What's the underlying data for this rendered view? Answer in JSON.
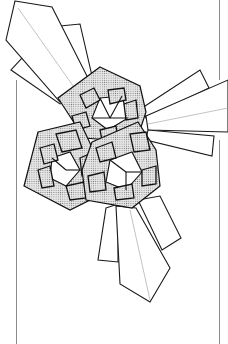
{
  "figure": {
    "kind": "origami line illustration",
    "units": 3,
    "ray_groups": [
      "top-left",
      "right",
      "bottom"
    ],
    "colors": {
      "background": "#ffffff",
      "outline": "#111111",
      "stipple_fill": "#c8c8c8",
      "frame_rule": "#8c8c8c",
      "crease": "#9a9a9a"
    }
  }
}
